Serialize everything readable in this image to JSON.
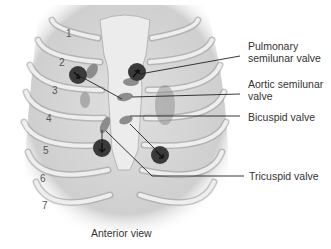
{
  "figure": {
    "caption": "Anterior view",
    "rib_numbers": [
      "1",
      "2",
      "3",
      "4",
      "5",
      "6",
      "7"
    ],
    "labels": [
      {
        "id": "pulmonary",
        "text": "Pulmonary\nsemilunar valve"
      },
      {
        "id": "aortic",
        "text": "Aortic semilunar\nvalve"
      },
      {
        "id": "bicuspid",
        "text": "Bicuspid valve"
      },
      {
        "id": "tricuspid",
        "text": "Tricuspid valve"
      }
    ],
    "colors": {
      "rib": "#e6e6e6",
      "rib_edge": "#9a9a9a",
      "background_chest": "#d6d6d6",
      "valve_shape": "#8c8c8c",
      "auscultation_circle": "#3a3a3a",
      "leader_line": "#222222"
    }
  }
}
